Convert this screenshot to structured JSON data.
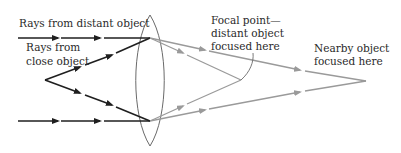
{
  "diagram": {
    "labels": {
      "distant_rays": "Rays from distant object",
      "close_rays_line1": "Rays from",
      "close_rays_line2": "close object",
      "focal_line1": "Focal point—",
      "focal_line2": "distant object",
      "focal_line3": "focused here",
      "nearby_line1": "Nearby object",
      "nearby_line2": "focused here"
    },
    "colors": {
      "incoming_rays": "#1f1f1f",
      "refracted_rays": "#9a9a9a",
      "lens_outline": "#6a6a6a",
      "text": "#2a2a2a"
    },
    "points": {
      "lens_top": [
        150,
        15
      ],
      "lens_bottom": [
        150,
        146
      ],
      "lens_exit_top": [
        150,
        38
      ],
      "lens_exit_bottom": [
        150,
        121
      ],
      "close_object": [
        45,
        80
      ],
      "focal_point_distant": [
        241,
        80
      ],
      "focus_point_nearby": [
        366,
        81
      ]
    }
  }
}
